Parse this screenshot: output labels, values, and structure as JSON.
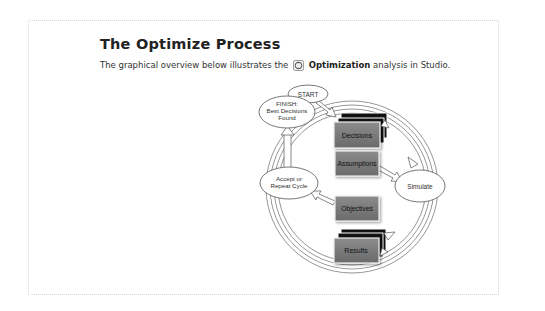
{
  "page": {
    "title": "The Optimize Process",
    "intro_before": "The graphical overview below illustrates the",
    "intro_keyword": "Optimization",
    "intro_after": "analysis in Studio.",
    "intro_icon": "optimization-icon"
  },
  "diagram": {
    "start": "START",
    "finish_line1": "FINISH:",
    "finish_line2": "Best Decisions",
    "finish_line3": "Found",
    "accept_line1": "Accept or",
    "accept_line2": "Repeat Cycle",
    "simulate": "Simulate",
    "boxes": {
      "decisions": "Decisions",
      "assumptions": "Assumptions",
      "objectives": "Objectives",
      "results": "Results"
    },
    "colors": {
      "box_fill": "#7a7a7a",
      "box_stack": "#111111",
      "ellipse_fill": "#ffffff",
      "stroke": "#555555"
    }
  }
}
